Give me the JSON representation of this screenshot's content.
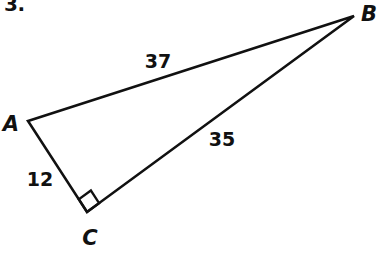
{
  "figure": {
    "problem_number": "3.",
    "shape": "right-triangle",
    "background_color": "#ffffff",
    "stroke_color": "#111111",
    "stroke_width": 2.6,
    "canvas": {
      "width": 383,
      "height": 257
    },
    "vertices": [
      {
        "name": "A",
        "label": "A",
        "x": 28,
        "y": 121,
        "label_x": 11,
        "label_y": 124
      },
      {
        "name": "B",
        "label": "B",
        "x": 354,
        "y": 16,
        "label_x": 369,
        "label_y": 14
      },
      {
        "name": "C",
        "label": "C",
        "x": 87,
        "y": 212,
        "label_x": 90,
        "label_y": 238
      }
    ],
    "sides": [
      {
        "name": "AB",
        "from": "A",
        "to": "B",
        "length_label": "37",
        "label_x": 158,
        "label_y": 61
      },
      {
        "name": "CB",
        "from": "C",
        "to": "B",
        "length_label": "35",
        "label_x": 222,
        "label_y": 139
      },
      {
        "name": "AC",
        "from": "A",
        "to": "C",
        "length_label": "12",
        "label_x": 40,
        "label_y": 179
      }
    ],
    "right_angle": {
      "at_vertex": "C",
      "marker": "square",
      "marker_size": 15
    }
  },
  "chart_data": {
    "type": "diagram",
    "title": "",
    "shape": "right triangle ABC",
    "labels": [
      "A",
      "B",
      "C"
    ],
    "side_lengths": {
      "AB": 37,
      "CB": 35,
      "AC": 12
    },
    "right_angle_at": "C"
  }
}
